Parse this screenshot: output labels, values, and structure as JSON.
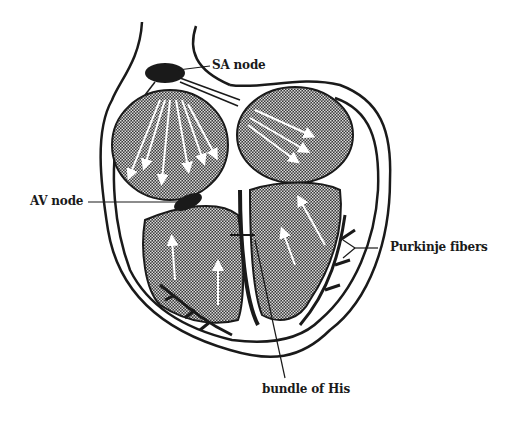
{
  "diagram": {
    "labels": {
      "sa_node": "SA node",
      "av_node": "AV node",
      "purkinje": "Purkinje fibers",
      "his": "bundle of His"
    },
    "colors": {
      "ink": "#1a1a1a",
      "background": "#ffffff",
      "chamber_fill": "#555555",
      "arrow": "#ffffff"
    }
  }
}
